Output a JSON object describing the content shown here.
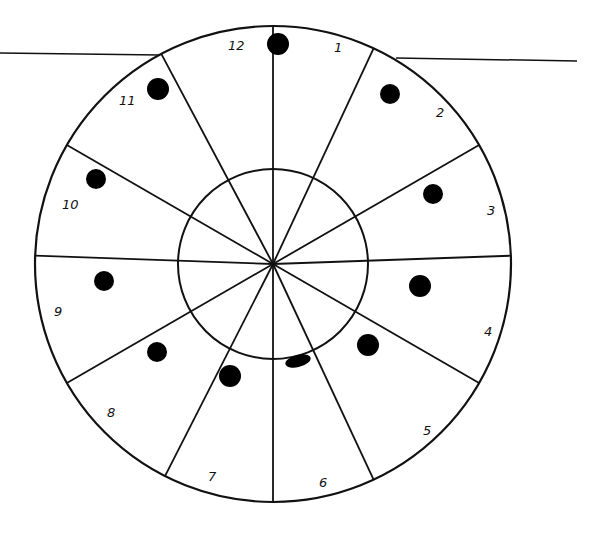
{
  "diagram": {
    "type": "clock-wheel",
    "center": [
      273,
      264
    ],
    "outer_radius": 238,
    "inner_radius": 95,
    "stroke_color": "#111111",
    "dot_color": "#000000",
    "background": "#ffffff",
    "spokes_angles_deg": [
      0,
      25,
      60,
      88,
      120,
      155,
      180,
      207,
      240,
      272,
      300,
      332
    ],
    "labels": [
      {
        "text": "12",
        "x": 228,
        "y": 50
      },
      {
        "text": "1",
        "x": 334,
        "y": 52
      },
      {
        "text": "2",
        "x": 436,
        "y": 117
      },
      {
        "text": "3",
        "x": 487,
        "y": 215
      },
      {
        "text": "4",
        "x": 484,
        "y": 336
      },
      {
        "text": "5",
        "x": 423,
        "y": 435
      },
      {
        "text": "6",
        "x": 319,
        "y": 487
      },
      {
        "text": "7",
        "x": 208,
        "y": 481
      },
      {
        "text": "8",
        "x": 107,
        "y": 417
      },
      {
        "text": "9",
        "x": 54,
        "y": 316
      },
      {
        "text": "10",
        "x": 62,
        "y": 209
      },
      {
        "text": "11",
        "x": 119,
        "y": 105
      }
    ],
    "dots": [
      {
        "segment": "12",
        "cx": 278,
        "cy": 44,
        "rx": 11,
        "ry": 11
      },
      {
        "segment": "11",
        "cx": 158,
        "cy": 89,
        "rx": 11,
        "ry": 11
      },
      {
        "segment": "1-2",
        "cx": 390,
        "cy": 94,
        "rx": 10,
        "ry": 10
      },
      {
        "segment": "10",
        "cx": 96,
        "cy": 179,
        "rx": 10,
        "ry": 10
      },
      {
        "segment": "3",
        "cx": 433,
        "cy": 194,
        "rx": 10,
        "ry": 10
      },
      {
        "segment": "9",
        "cx": 104,
        "cy": 281,
        "rx": 10,
        "ry": 10
      },
      {
        "segment": "4",
        "cx": 420,
        "cy": 286,
        "rx": 11,
        "ry": 11
      },
      {
        "segment": "5",
        "cx": 368,
        "cy": 345,
        "rx": 11,
        "ry": 11
      },
      {
        "segment": "8",
        "cx": 157,
        "cy": 352,
        "rx": 10,
        "ry": 10
      },
      {
        "segment": "6",
        "cx": 298,
        "cy": 361,
        "rx": 13,
        "ry": 6
      },
      {
        "segment": "7",
        "cx": 230,
        "cy": 376,
        "rx": 11,
        "ry": 11
      }
    ],
    "horizon_lines": [
      {
        "x1": 0,
        "y1": 53,
        "x2": 160,
        "y2": 55
      },
      {
        "x1": 396,
        "y1": 58,
        "x2": 577,
        "y2": 61
      }
    ]
  }
}
